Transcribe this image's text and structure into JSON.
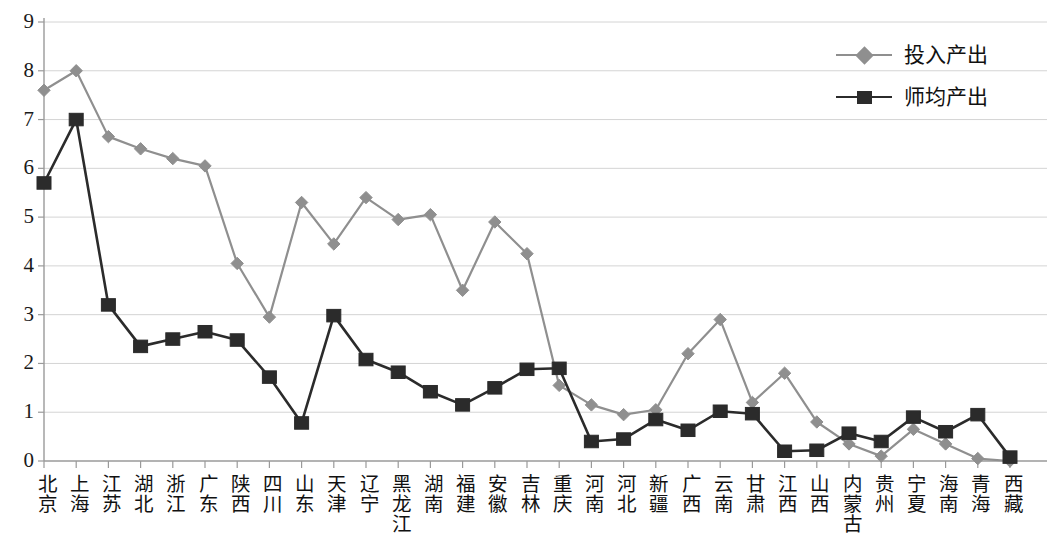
{
  "chart_data": {
    "type": "line",
    "title": "",
    "xlabel": "",
    "ylabel": "",
    "ylim": [
      0,
      9
    ],
    "ytick_labels": [
      "0",
      "1",
      "2",
      "3",
      "4",
      "5",
      "6",
      "7",
      "8",
      "9"
    ],
    "grid": true,
    "legend_position": "top-right",
    "categories": [
      "北京",
      "上海",
      "江苏",
      "湖北",
      "浙江",
      "广东",
      "陕西",
      "四川",
      "山东",
      "天津",
      "辽宁",
      "黑龙江",
      "湖南",
      "福建",
      "安徽",
      "吉林",
      "重庆",
      "河南",
      "河北",
      "新疆",
      "广西",
      "云南",
      "甘肃",
      "江西",
      "山西",
      "内蒙古",
      "贵州",
      "宁夏",
      "海南",
      "青海",
      "西藏"
    ],
    "series": [
      {
        "name": "投入产出",
        "color": "#8f8f8f",
        "marker": "diamond",
        "values": [
          7.6,
          8.0,
          6.65,
          6.4,
          6.2,
          6.05,
          4.05,
          2.95,
          5.3,
          4.45,
          5.4,
          4.95,
          5.05,
          3.5,
          4.9,
          4.25,
          1.55,
          1.15,
          0.95,
          1.05,
          2.2,
          2.9,
          1.2,
          1.8,
          0.8,
          0.35,
          0.1,
          0.65,
          0.35,
          0.05,
          0.0
        ]
      },
      {
        "name": "师均产出",
        "color": "#2b2b2b",
        "marker": "square",
        "values": [
          5.7,
          7.0,
          3.2,
          2.35,
          2.5,
          2.65,
          2.48,
          1.72,
          0.78,
          2.98,
          2.08,
          1.82,
          1.42,
          1.15,
          1.5,
          1.88,
          1.9,
          0.4,
          0.45,
          0.85,
          0.63,
          1.02,
          0.97,
          0.2,
          0.22,
          0.57,
          0.4,
          0.9,
          0.6,
          0.95,
          0.08
        ]
      }
    ]
  },
  "legend": {
    "items": [
      {
        "label": "投入产出"
      },
      {
        "label": "师均产出"
      }
    ]
  },
  "axes": {
    "y_ticks": [
      "9",
      "8",
      "7",
      "6",
      "5",
      "4",
      "3",
      "2",
      "1",
      "0"
    ]
  },
  "colors": {
    "series_input_output": "#8f8f8f",
    "series_per_teacher": "#2b2b2b",
    "gridline": "#d4d4d4",
    "axis": "#9a9a9a",
    "text": "#111111",
    "background": "#ffffff"
  }
}
